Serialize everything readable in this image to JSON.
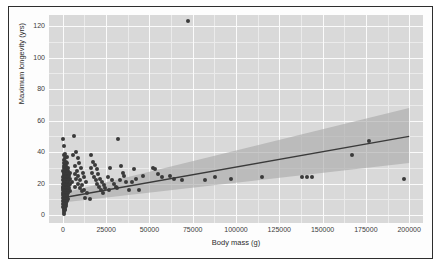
{
  "chart_data": {
    "type": "scatter",
    "title": "",
    "subtitle": "",
    "xlabel": "Body mass (g)",
    "ylabel": "Maximum longevity (yrs)",
    "xlim": [
      -8000,
      208000
    ],
    "ylim": [
      -5,
      127
    ],
    "xticks": [
      0,
      25000,
      50000,
      75000,
      100000,
      125000,
      150000,
      175000,
      200000
    ],
    "xticklabels": [
      "0",
      "25000",
      "50000",
      "75000",
      "100000",
      "125000",
      "150000",
      "175000",
      "200000"
    ],
    "yticks": [
      0,
      20,
      40,
      60,
      80,
      100,
      120
    ],
    "yticklabels": [
      "0",
      "20",
      "40",
      "60",
      "80",
      "100",
      "120"
    ],
    "grid": true,
    "grid_style": "ggplot-grey-panel-white-gridlines",
    "legend": "none",
    "panel_background": "#d9d9d9",
    "gridline_major_color": "#fbfbfb",
    "gridline_minor_color": "#ebebeb",
    "point_color": "#3a3a3a",
    "point_size": 4,
    "regression": {
      "type": "linear",
      "line_color": "#3a3a3a",
      "band_color": "#a8a8a8",
      "band_label": "95% confidence interval",
      "x_start": 0,
      "y_start": 11,
      "x_end": 200000,
      "y_end": 50,
      "band_lower_start": 8,
      "band_upper_start": 14,
      "band_lower_end": 33,
      "band_upper_end": 68
    },
    "points": [
      {
        "x": 300,
        "y": 48
      },
      {
        "x": 900,
        "y": 44
      },
      {
        "x": 1500,
        "y": 39
      },
      {
        "x": 600,
        "y": 38
      },
      {
        "x": 2200,
        "y": 37
      },
      {
        "x": 1100,
        "y": 36
      },
      {
        "x": 500,
        "y": 35
      },
      {
        "x": 1800,
        "y": 34
      },
      {
        "x": 2600,
        "y": 33
      },
      {
        "x": 800,
        "y": 33
      },
      {
        "x": 1300,
        "y": 32
      },
      {
        "x": 400,
        "y": 31
      },
      {
        "x": 2000,
        "y": 31
      },
      {
        "x": 3100,
        "y": 30
      },
      {
        "x": 700,
        "y": 30
      },
      {
        "x": 1600,
        "y": 29
      },
      {
        "x": 2400,
        "y": 29
      },
      {
        "x": 350,
        "y": 28
      },
      {
        "x": 1200,
        "y": 28
      },
      {
        "x": 2900,
        "y": 28
      },
      {
        "x": 4200,
        "y": 27
      },
      {
        "x": 900,
        "y": 27
      },
      {
        "x": 1900,
        "y": 27
      },
      {
        "x": 3400,
        "y": 26
      },
      {
        "x": 600,
        "y": 26
      },
      {
        "x": 1400,
        "y": 26
      },
      {
        "x": 2300,
        "y": 26
      },
      {
        "x": 500,
        "y": 25
      },
      {
        "x": 1000,
        "y": 25
      },
      {
        "x": 1700,
        "y": 25
      },
      {
        "x": 2700,
        "y": 25
      },
      {
        "x": 3800,
        "y": 25
      },
      {
        "x": 300,
        "y": 24
      },
      {
        "x": 800,
        "y": 24
      },
      {
        "x": 1300,
        "y": 24
      },
      {
        "x": 2100,
        "y": 24
      },
      {
        "x": 3000,
        "y": 24
      },
      {
        "x": 450,
        "y": 23
      },
      {
        "x": 1100,
        "y": 23
      },
      {
        "x": 1600,
        "y": 23
      },
      {
        "x": 2500,
        "y": 23
      },
      {
        "x": 4000,
        "y": 23
      },
      {
        "x": 250,
        "y": 22
      },
      {
        "x": 700,
        "y": 22
      },
      {
        "x": 1200,
        "y": 22
      },
      {
        "x": 1800,
        "y": 22
      },
      {
        "x": 2800,
        "y": 22
      },
      {
        "x": 3600,
        "y": 22
      },
      {
        "x": 400,
        "y": 21
      },
      {
        "x": 950,
        "y": 21
      },
      {
        "x": 1500,
        "y": 21
      },
      {
        "x": 2200,
        "y": 21
      },
      {
        "x": 3200,
        "y": 21
      },
      {
        "x": 5000,
        "y": 21
      },
      {
        "x": 300,
        "y": 20
      },
      {
        "x": 750,
        "y": 20
      },
      {
        "x": 1250,
        "y": 20
      },
      {
        "x": 1950,
        "y": 20
      },
      {
        "x": 2600,
        "y": 20
      },
      {
        "x": 4400,
        "y": 20
      },
      {
        "x": 500,
        "y": 19
      },
      {
        "x": 1000,
        "y": 19
      },
      {
        "x": 1650,
        "y": 19
      },
      {
        "x": 2400,
        "y": 19
      },
      {
        "x": 3300,
        "y": 19
      },
      {
        "x": 200,
        "y": 18
      },
      {
        "x": 850,
        "y": 18
      },
      {
        "x": 1400,
        "y": 18
      },
      {
        "x": 2050,
        "y": 18
      },
      {
        "x": 2900,
        "y": 18
      },
      {
        "x": 350,
        "y": 17
      },
      {
        "x": 900,
        "y": 17
      },
      {
        "x": 1550,
        "y": 17
      },
      {
        "x": 2300,
        "y": 17
      },
      {
        "x": 3700,
        "y": 17
      },
      {
        "x": 250,
        "y": 16
      },
      {
        "x": 700,
        "y": 16
      },
      {
        "x": 1300,
        "y": 16
      },
      {
        "x": 1900,
        "y": 16
      },
      {
        "x": 2700,
        "y": 16
      },
      {
        "x": 450,
        "y": 15
      },
      {
        "x": 1050,
        "y": 15
      },
      {
        "x": 1700,
        "y": 15
      },
      {
        "x": 2500,
        "y": 15
      },
      {
        "x": 3900,
        "y": 15
      },
      {
        "x": 300,
        "y": 14
      },
      {
        "x": 800,
        "y": 14
      },
      {
        "x": 1450,
        "y": 14
      },
      {
        "x": 2100,
        "y": 14
      },
      {
        "x": 3000,
        "y": 14
      },
      {
        "x": 200,
        "y": 13
      },
      {
        "x": 650,
        "y": 13
      },
      {
        "x": 1200,
        "y": 13
      },
      {
        "x": 1850,
        "y": 13
      },
      {
        "x": 2600,
        "y": 13
      },
      {
        "x": 400,
        "y": 12
      },
      {
        "x": 950,
        "y": 12
      },
      {
        "x": 1600,
        "y": 12
      },
      {
        "x": 2350,
        "y": 12
      },
      {
        "x": 300,
        "y": 11
      },
      {
        "x": 750,
        "y": 11
      },
      {
        "x": 1400,
        "y": 11
      },
      {
        "x": 2200,
        "y": 11
      },
      {
        "x": 500,
        "y": 10
      },
      {
        "x": 1100,
        "y": 10
      },
      {
        "x": 1750,
        "y": 10
      },
      {
        "x": 2800,
        "y": 10
      },
      {
        "x": 250,
        "y": 9
      },
      {
        "x": 850,
        "y": 9
      },
      {
        "x": 1500,
        "y": 9
      },
      {
        "x": 2400,
        "y": 9
      },
      {
        "x": 400,
        "y": 8
      },
      {
        "x": 1000,
        "y": 8
      },
      {
        "x": 1650,
        "y": 8
      },
      {
        "x": 300,
        "y": 7
      },
      {
        "x": 900,
        "y": 7
      },
      {
        "x": 1800,
        "y": 7
      },
      {
        "x": 500,
        "y": 6
      },
      {
        "x": 1200,
        "y": 6
      },
      {
        "x": 2000,
        "y": 6
      },
      {
        "x": 350,
        "y": 5
      },
      {
        "x": 1000,
        "y": 5
      },
      {
        "x": 700,
        "y": 4
      },
      {
        "x": 1500,
        "y": 4
      },
      {
        "x": 450,
        "y": 3
      },
      {
        "x": 1100,
        "y": 3
      },
      {
        "x": 800,
        "y": 2
      },
      {
        "x": 600,
        "y": 1
      },
      {
        "x": 6500,
        "y": 50
      },
      {
        "x": 7500,
        "y": 40
      },
      {
        "x": 6000,
        "y": 38
      },
      {
        "x": 8500,
        "y": 36
      },
      {
        "x": 9500,
        "y": 33
      },
      {
        "x": 7000,
        "y": 31
      },
      {
        "x": 10500,
        "y": 30
      },
      {
        "x": 8000,
        "y": 28
      },
      {
        "x": 11500,
        "y": 27
      },
      {
        "x": 6800,
        "y": 26
      },
      {
        "x": 9000,
        "y": 25
      },
      {
        "x": 12500,
        "y": 24
      },
      {
        "x": 7800,
        "y": 23
      },
      {
        "x": 10000,
        "y": 22
      },
      {
        "x": 13500,
        "y": 21
      },
      {
        "x": 8800,
        "y": 20
      },
      {
        "x": 11000,
        "y": 19
      },
      {
        "x": 7200,
        "y": 18
      },
      {
        "x": 9800,
        "y": 17
      },
      {
        "x": 12000,
        "y": 16
      },
      {
        "x": 10800,
        "y": 15
      },
      {
        "x": 14000,
        "y": 14
      },
      {
        "x": 13000,
        "y": 11
      },
      {
        "x": 15500,
        "y": 10
      },
      {
        "x": 16500,
        "y": 38
      },
      {
        "x": 17500,
        "y": 34
      },
      {
        "x": 18500,
        "y": 32
      },
      {
        "x": 16000,
        "y": 30
      },
      {
        "x": 19500,
        "y": 29
      },
      {
        "x": 17000,
        "y": 27
      },
      {
        "x": 20500,
        "y": 26
      },
      {
        "x": 18000,
        "y": 24
      },
      {
        "x": 21500,
        "y": 23
      },
      {
        "x": 19000,
        "y": 22
      },
      {
        "x": 22500,
        "y": 21
      },
      {
        "x": 20000,
        "y": 20
      },
      {
        "x": 23500,
        "y": 19
      },
      {
        "x": 21000,
        "y": 18
      },
      {
        "x": 24500,
        "y": 17
      },
      {
        "x": 22000,
        "y": 16
      },
      {
        "x": 23000,
        "y": 14
      },
      {
        "x": 27000,
        "y": 30
      },
      {
        "x": 26000,
        "y": 24
      },
      {
        "x": 28500,
        "y": 22
      },
      {
        "x": 29500,
        "y": 20
      },
      {
        "x": 30500,
        "y": 18
      },
      {
        "x": 26500,
        "y": 16
      },
      {
        "x": 32000,
        "y": 48
      },
      {
        "x": 33500,
        "y": 31
      },
      {
        "x": 34500,
        "y": 27
      },
      {
        "x": 35500,
        "y": 25
      },
      {
        "x": 33000,
        "y": 22
      },
      {
        "x": 36500,
        "y": 21
      },
      {
        "x": 31500,
        "y": 17
      },
      {
        "x": 38000,
        "y": 16
      },
      {
        "x": 41000,
        "y": 29
      },
      {
        "x": 42500,
        "y": 23
      },
      {
        "x": 40000,
        "y": 21
      },
      {
        "x": 44000,
        "y": 16
      },
      {
        "x": 46000,
        "y": 25
      },
      {
        "x": 52000,
        "y": 30
      },
      {
        "x": 53500,
        "y": 29
      },
      {
        "x": 55000,
        "y": 26
      },
      {
        "x": 57000,
        "y": 24
      },
      {
        "x": 62000,
        "y": 25
      },
      {
        "x": 64000,
        "y": 23
      },
      {
        "x": 69000,
        "y": 22
      },
      {
        "x": 72000,
        "y": 123
      },
      {
        "x": 82000,
        "y": 22
      },
      {
        "x": 88000,
        "y": 24
      },
      {
        "x": 97000,
        "y": 23
      },
      {
        "x": 115000,
        "y": 24
      },
      {
        "x": 138000,
        "y": 24
      },
      {
        "x": 141000,
        "y": 24
      },
      {
        "x": 144000,
        "y": 24
      },
      {
        "x": 167000,
        "y": 38
      },
      {
        "x": 177000,
        "y": 47
      },
      {
        "x": 197000,
        "y": 23
      }
    ]
  }
}
